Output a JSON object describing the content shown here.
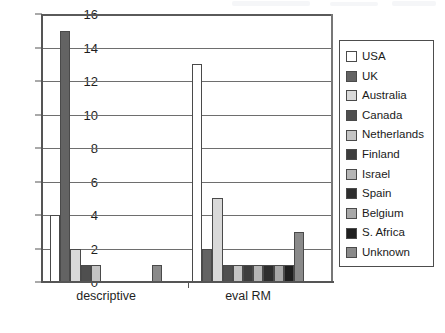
{
  "chart_data": {
    "type": "bar",
    "title": "",
    "xlabel": "",
    "ylabel": "",
    "categories": [
      "descriptive",
      "eval RM"
    ],
    "ylim": [
      0,
      16
    ],
    "yticks": [
      0,
      2,
      4,
      6,
      8,
      10,
      12,
      14,
      16
    ],
    "grid": true,
    "legend_position": "right",
    "series": [
      {
        "name": "USA",
        "color": "#ffffff",
        "values": [
          4,
          13
        ]
      },
      {
        "name": "UK",
        "color": "#636363",
        "values": [
          15,
          2
        ]
      },
      {
        "name": "Australia",
        "color": "#d9d9d9",
        "values": [
          2,
          5
        ]
      },
      {
        "name": "Canada",
        "color": "#4f4f4f",
        "values": [
          1,
          1
        ]
      },
      {
        "name": "Netherlands",
        "color": "#c4c4c4",
        "values": [
          1,
          1
        ]
      },
      {
        "name": "Finland",
        "color": "#3d3d3d",
        "values": [
          0,
          1
        ]
      },
      {
        "name": "Israel",
        "color": "#b5b5b5",
        "values": [
          0,
          1
        ]
      },
      {
        "name": "Spain",
        "color": "#2e2e2e",
        "values": [
          0,
          1
        ]
      },
      {
        "name": "Belgium",
        "color": "#a8a8a8",
        "values": [
          0,
          1
        ]
      },
      {
        "name": "S. Africa",
        "color": "#1f1f1f",
        "values": [
          0,
          1
        ]
      },
      {
        "name": "Unknown",
        "color": "#8a8a8a",
        "values": [
          1,
          3
        ]
      }
    ]
  },
  "axis": {
    "y_tick_labels": [
      "0",
      "2",
      "4",
      "6",
      "8",
      "10",
      "12",
      "14",
      "16"
    ]
  },
  "legend": {
    "items": [
      {
        "label": "USA"
      },
      {
        "label": "UK"
      },
      {
        "label": "Australia"
      },
      {
        "label": "Canada"
      },
      {
        "label": "Netherlands"
      },
      {
        "label": "Finland"
      },
      {
        "label": "Israel"
      },
      {
        "label": "Spain"
      },
      {
        "label": "Belgium"
      },
      {
        "label": "S. Africa"
      },
      {
        "label": "Unknown"
      }
    ]
  }
}
